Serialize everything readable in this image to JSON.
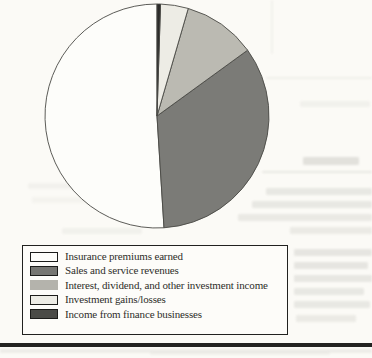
{
  "figure": {
    "kind": "scanned book figure",
    "caption": "",
    "title": ""
  },
  "chart_data": {
    "type": "pie",
    "note": "no numeric labels printed; values estimated from slice angles, percent of circle",
    "start_angle": "12 o'clock",
    "direction": "counterclockwise",
    "legend_position": "boxed legend below chart, left aligned",
    "stroke_color": "#4a4a45",
    "series": [
      {
        "label": "Insurance premiums earned",
        "value": 51,
        "color": "#fdfdfa",
        "swatch_color": "#fdfdfa",
        "swatch_border": "#1c1c1a"
      },
      {
        "label": "Sales and service revenues",
        "value": 34,
        "color": "#7b7b77",
        "swatch_color": "#767672",
        "swatch_border": "#1c1c1a"
      },
      {
        "label": "Interest, dividend, and other investment income",
        "value": 10.5,
        "color": "#bbbab2",
        "swatch_color": "#b4b3ac",
        "swatch_border": "none"
      },
      {
        "label": "Investment gains/losses",
        "value": 4,
        "color": "#edece5",
        "swatch_color": "#edece5",
        "swatch_border": "#1c1c1a"
      },
      {
        "label": "Income from finance businesses",
        "value": 0.5,
        "color": "#2b2b29",
        "swatch_color": "#4b4b47",
        "swatch_border": "#1c1c1a"
      }
    ]
  }
}
